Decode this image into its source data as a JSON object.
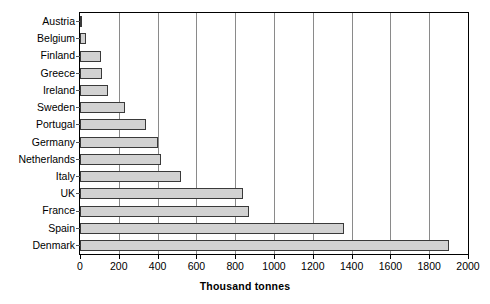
{
  "chart_data": {
    "type": "bar",
    "orientation": "horizontal",
    "title": "",
    "xlabel": "Thousand tonnes",
    "ylabel": "",
    "xlim": [
      0,
      2000
    ],
    "xticks": [
      0,
      200,
      400,
      600,
      800,
      1000,
      1200,
      1400,
      1600,
      1800,
      2000
    ],
    "grid": "vertical",
    "legend": "none",
    "categories": [
      "Austria",
      "Belgium",
      "Finland",
      "Greece",
      "Ireland",
      "Sweden",
      "Portugal",
      "Germany",
      "Netherlands",
      "Italy",
      "UK",
      "France",
      "Spain",
      "Denmark"
    ],
    "values": [
      10,
      30,
      110,
      115,
      145,
      230,
      340,
      400,
      420,
      520,
      840,
      870,
      1360,
      1900
    ],
    "colors": {
      "bar_fill": "#d2d2d2",
      "bar_border": "#3a3a3a",
      "gridline": "#8a8a8a",
      "axis": "#000000",
      "text": "#000000",
      "background": "#ffffff"
    }
  }
}
